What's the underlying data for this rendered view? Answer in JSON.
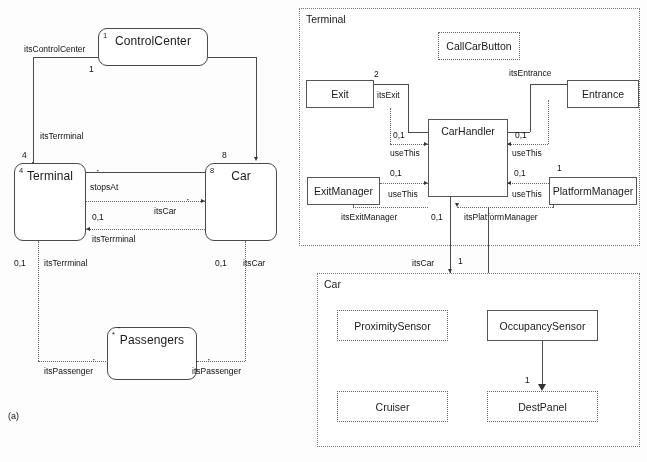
{
  "figure": {
    "label": "(a)"
  },
  "left_diagram": {
    "classes": [
      {
        "name": "ControlCenter",
        "corner_mult": "1"
      },
      {
        "name": "Terminal",
        "corner_mult": "4"
      },
      {
        "name": "Car",
        "corner_mult": "8"
      },
      {
        "name": "Passengers",
        "corner_mult": "*"
      }
    ],
    "associations": [
      {
        "role": "itsControlCenter",
        "mult_near": "1",
        "mult_far": "4"
      },
      {
        "role": "itsTerrminal",
        "mult_near": "4",
        "mult_far": "1"
      },
      {
        "role": "stopsAt",
        "mult_near": "*",
        "mult_far": "8"
      },
      {
        "role": "itsCar",
        "mult_near": "*",
        "mult_far": "0,1"
      },
      {
        "role": "itsTerrminal",
        "mult_near": "0,1",
        "mult_far": "*"
      },
      {
        "role": "itsPassenger",
        "mult_near": "*",
        "mult_far": "0,1"
      },
      {
        "role": "itsCar",
        "mult_near": "0,1",
        "mult_far": "*"
      },
      {
        "role": "itsPassenger",
        "mult_near": "*",
        "mult_far": "*"
      }
    ],
    "labels": {
      "its_control_center": "itsControlCenter",
      "its_terrminal_upper": "itsTerrminal",
      "stops_at": "stopsAt",
      "its_car_mid": "itsCar",
      "its_terrminal_mid": "itsTerrminal",
      "its_terrminal_lower": "itsTerrminal",
      "its_car_right": "itsCar",
      "its_passenger_left": "itsPassenger",
      "its_passenger_right": "itsPassenger"
    },
    "multiplicities": {
      "cc_bottom": "1",
      "terminal_top": "4",
      "car_top": "8",
      "terminal_mid": "0,1",
      "terminal_bottom": "0,1",
      "car_bottom": "0,1"
    },
    "stars": {
      "stops_at": "*",
      "its_car": "*",
      "pass_left": "*",
      "pass_right": "*",
      "pass_top": "*"
    }
  },
  "terminal_panel": {
    "title": "Terminal",
    "boxes": [
      {
        "name": "CallCarButton"
      },
      {
        "name": "Exit"
      },
      {
        "name": "Entrance"
      },
      {
        "name": "CarHandler"
      },
      {
        "name": "ExitManager"
      },
      {
        "name": "PlatformManager"
      }
    ],
    "labels": {
      "its_exit": "itsExit",
      "its_entrance": "itsEntrance",
      "use_this_1": "useThis",
      "use_this_2": "useThis",
      "use_this_3": "useThis",
      "use_this_4": "useThis",
      "its_exit_manager": "itsExitManager",
      "its_platform_manager": "itsPlatformManager"
    },
    "multiplicities": {
      "exit_top": "2",
      "exit_handler": "0,1",
      "exit_manager": "0,1",
      "entrance_handler": "0,1",
      "platform_manager": "0,1",
      "platform_one": "1",
      "handler_bottom": "0,1"
    }
  },
  "car_panel": {
    "title": "Car",
    "boxes": [
      {
        "name": "ProximitySensor"
      },
      {
        "name": "OccupancySensor"
      },
      {
        "name": "Cruiser"
      },
      {
        "name": "DestPanel"
      }
    ],
    "labels": {
      "its_car": "itsCar"
    },
    "multiplicities": {
      "its_car": "1",
      "dest_panel": "1"
    }
  },
  "colors": {
    "line": "#4a4a4a",
    "dotted": "#666666",
    "text": "#1a1a1a",
    "background": "#ffffff"
  }
}
